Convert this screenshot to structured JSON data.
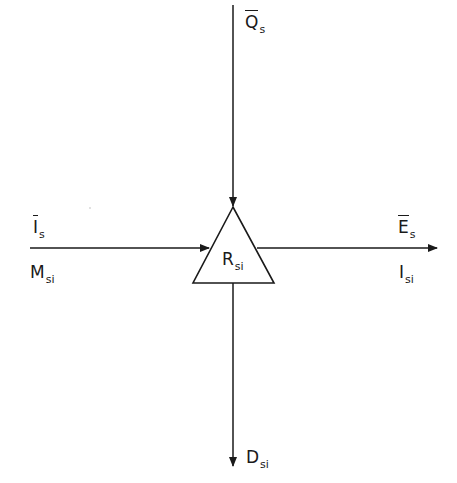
{
  "diagram": {
    "node": {
      "id": "R",
      "label": "R",
      "subscript": "si",
      "shape": "triangle"
    },
    "arrows": [
      {
        "id": "top",
        "direction": "in",
        "from": "top",
        "labels": [
          {
            "text": "Q",
            "subscript": "s",
            "overline": true
          }
        ]
      },
      {
        "id": "left",
        "direction": "in",
        "from": "left",
        "labels": [
          {
            "text": "I",
            "subscript": "s",
            "overline": true
          },
          {
            "text": "M",
            "subscript": "si",
            "overline": false
          }
        ]
      },
      {
        "id": "right",
        "direction": "out",
        "to": "right",
        "labels": [
          {
            "text": "E",
            "subscript": "s",
            "overline": true
          },
          {
            "text": "I",
            "subscript": "si",
            "overline": false
          }
        ]
      },
      {
        "id": "bottom",
        "direction": "out",
        "to": "bottom",
        "labels": [
          {
            "text": "D",
            "subscript": "si",
            "overline": false
          }
        ]
      }
    ]
  },
  "labels": {
    "q_s": {
      "main": "Q",
      "sub": "s"
    },
    "i_s": {
      "main": "I",
      "sub": "s"
    },
    "m_si": {
      "main": "M",
      "sub": "si"
    },
    "r_si": {
      "main": "R",
      "sub": "si"
    },
    "e_s": {
      "main": "E",
      "sub": "s"
    },
    "i_si": {
      "main": "I",
      "sub": "si"
    },
    "d_si": {
      "main": "D",
      "sub": "si"
    }
  },
  "colors": {
    "stroke": "#1a1a1a",
    "background": "#ffffff"
  }
}
